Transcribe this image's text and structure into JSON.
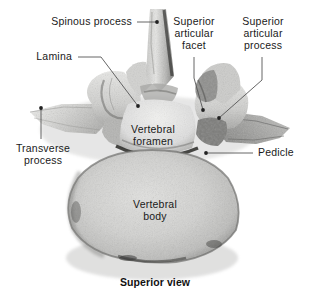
{
  "figure": {
    "caption": "Superior view",
    "background_color": "#ffffff",
    "text_color": "#1a1a1a",
    "leader_color": "#555555"
  },
  "labels": [
    {
      "id": "spinous-process",
      "text": "Spinous process",
      "align": "right",
      "x": 22,
      "y": 16,
      "width": 110,
      "leader": {
        "type": "horizontal",
        "x1": 137,
        "y1": 22,
        "x2": 157,
        "y2": 22,
        "dot": "end"
      }
    },
    {
      "id": "lamina",
      "text": "Lamina",
      "align": "right",
      "x": 14,
      "y": 51,
      "width": 58,
      "leader": {
        "type": "elbow",
        "x1": 78,
        "y1": 57,
        "x2": 101,
        "y2": 57,
        "x3": 138,
        "y3": 106,
        "dot": "end"
      }
    },
    {
      "id": "superior-articular-facet",
      "text": "Superior\narticular\nfacet",
      "align": "center",
      "x": 166,
      "y": 16,
      "width": 56,
      "leader": {
        "type": "vertical",
        "x1": 194,
        "y1": 57,
        "x2": 203,
        "y2": 110,
        "dot": "end"
      }
    },
    {
      "id": "superior-articular-process",
      "text": "Superior\narticular\nprocess",
      "align": "center",
      "x": 232,
      "y": 16,
      "width": 62,
      "leader": {
        "type": "vertical",
        "x1": 262,
        "y1": 57,
        "x2": 219,
        "y2": 118,
        "dot": "end"
      }
    },
    {
      "id": "transverse-process",
      "text": "Transverse\nprocess",
      "align": "center",
      "x": 10,
      "y": 143,
      "width": 66,
      "leader": {
        "type": "vertical",
        "x1": 41,
        "y1": 139,
        "x2": 41,
        "y2": 108,
        "dot": "end"
      }
    },
    {
      "id": "vertebral-foramen",
      "text": "Vertebral\nforamen",
      "align": "center",
      "x": 120,
      "y": 124,
      "width": 66,
      "leader": null
    },
    {
      "id": "pedicle",
      "text": "Pedicle",
      "align": "left",
      "x": 258,
      "y": 147,
      "width": 48,
      "leader": {
        "type": "horizontal",
        "x1": 253,
        "y1": 153,
        "x2": 206,
        "y2": 153,
        "dot": "end"
      }
    },
    {
      "id": "vertebral-body",
      "text": "Vertebral\nbody",
      "align": "center",
      "x": 122,
      "y": 199,
      "width": 66,
      "leader": null
    }
  ],
  "caption_position": {
    "x": 105,
    "y": 276,
    "width": 100
  }
}
